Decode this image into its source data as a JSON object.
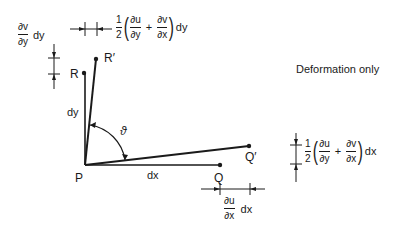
{
  "title_label": "Deformation only",
  "points": {
    "P": "P",
    "Q": "Q",
    "Q_prime": "Q′",
    "R": "R",
    "R_prime": "R′"
  },
  "segments": {
    "dx": "dx",
    "dy": "dy"
  },
  "angle_label": "ϑ",
  "annotations": {
    "top_left": {
      "num": "∂v",
      "den": "∂y",
      "suffix": "dy"
    },
    "top_shear": {
      "coef_num": "1",
      "coef_den": "2",
      "f1_num": "∂u",
      "f1_den": "∂y",
      "plus": "+",
      "f2_num": "∂v",
      "f2_den": "∂x",
      "suffix": "dy"
    },
    "right_shear": {
      "coef_num": "1",
      "coef_den": "2",
      "f1_num": "∂u",
      "f1_den": "∂y",
      "plus": "+",
      "f2_num": "∂v",
      "f2_den": "∂x",
      "suffix": "dx"
    },
    "bottom": {
      "num": "∂u",
      "den": "∂x",
      "suffix": "dx"
    }
  },
  "colors": {
    "ink": "#1a1a1a",
    "background": "#ffffff"
  }
}
